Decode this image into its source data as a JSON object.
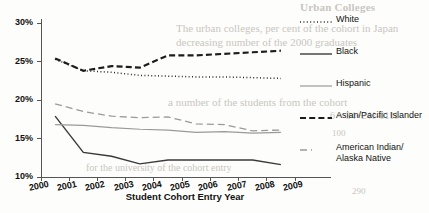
{
  "chart_data": {
    "type": "line",
    "title": "",
    "xlabel": "Student Cohort Entry Year",
    "ylabel": "",
    "xlim": [
      2000,
      2009
    ],
    "ylim": [
      10,
      30
    ],
    "ytick_labels": [
      "10%",
      "15%",
      "20%",
      "25%",
      "30%"
    ],
    "ytick_values": [
      10,
      15,
      20,
      25,
      30
    ],
    "xtick_labels": [
      "2000",
      "2001",
      "2002",
      "2003",
      "2004",
      "2005",
      "2006",
      "2007",
      "2008",
      "2009"
    ],
    "xtick_values": [
      2000,
      2001,
      2002,
      2003,
      2004,
      2005,
      2006,
      2007,
      2008,
      2009
    ],
    "x": [
      2000.5,
      2001.5,
      2002.5,
      2003.5,
      2004.5,
      2005.5,
      2006.5,
      2007.5,
      2008.5
    ],
    "grid": false,
    "legend_position": "right",
    "series": [
      {
        "name": "White",
        "style": "dotted",
        "color": "#2b2b2b",
        "values": [
          25.3,
          23.8,
          23.6,
          23.2,
          23.1,
          23.0,
          23.0,
          22.9,
          22.8
        ]
      },
      {
        "name": "Black",
        "style": "solid",
        "color": "#3a3a3a",
        "values": [
          17.9,
          13.2,
          12.7,
          11.7,
          12.2,
          12.2,
          12.2,
          12.2,
          11.6
        ]
      },
      {
        "name": "Hispanic",
        "style": "solid-gray",
        "color": "#9a9a9a",
        "values": [
          16.8,
          16.7,
          16.4,
          16.2,
          16.1,
          15.8,
          15.9,
          15.7,
          15.8
        ]
      },
      {
        "name": "Asian/Pacific Islander",
        "style": "dashed-bold",
        "color": "#1c1c1c",
        "values": [
          25.4,
          23.8,
          24.4,
          24.2,
          25.8,
          25.8,
          26.0,
          26.2,
          26.4
        ]
      },
      {
        "name": "American Indian/\nAlaska Native",
        "style": "dashed-gray",
        "color": "#9a9a9a",
        "values": [
          19.5,
          18.5,
          17.9,
          17.7,
          17.8,
          16.9,
          16.8,
          16.0,
          16.1
        ]
      }
    ]
  },
  "legend": {
    "items": [
      {
        "label": "White",
        "label2": "",
        "key": "dotted"
      },
      {
        "label": "Black",
        "label2": "",
        "key": "solid"
      },
      {
        "label": "Hispanic",
        "label2": "",
        "key": "solid-gray"
      },
      {
        "label": "Asian/Pacific Islander",
        "label2": "",
        "key": "dashed-bold"
      },
      {
        "label": "American Indian/",
        "label2": "Alaska Native",
        "key": "dashed-gray"
      }
    ]
  },
  "axis": {
    "x_title": "Student Cohort Entry Year"
  },
  "background_text": {
    "b1": "Urban Colleges",
    "b2": "The urban colleges, per cent of the cohort in Japan",
    "b3": "decreasing number of the 2000 graduates",
    "b4": "a number of the students from the cohort",
    "b5": "6 = 34+241-0111",
    "b6": "100",
    "b7": "for the university of the cohort entry",
    "b8": "290"
  },
  "colors": {
    "ink": "#1c1c1c",
    "gray": "#9a9a9a",
    "paper": "#fdfdfb"
  }
}
